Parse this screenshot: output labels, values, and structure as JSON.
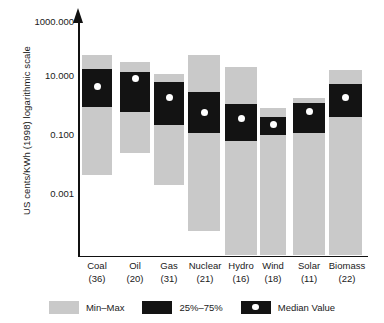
{
  "chart_data": {
    "type": "bar",
    "title": "",
    "subtitle": "",
    "xlabel": "",
    "ylabel": "US cents/KWh (1998) logarithmic scale",
    "scale": "log10",
    "ylim": [
      0.001,
      1000.0
    ],
    "grid": false,
    "legend_position": "bottom",
    "ytick_labels": [
      "1000.000",
      "10.000",
      "0.100",
      "0.001"
    ],
    "ytick_values": [
      1000.0,
      10.0,
      0.1,
      0.001
    ],
    "categories": [
      "Coal",
      "Oil",
      "Gas",
      "Nuclear",
      "Hydro",
      "Wind",
      "Solar",
      "Biomass"
    ],
    "category_counts": [
      "(36)",
      "(20)",
      "(31)",
      "(21)",
      "(16)",
      "(18)",
      "(11)",
      "(22)"
    ],
    "series": [
      {
        "name": "Min-Max",
        "values": [
          [
            0.004,
            60.0
          ],
          [
            0.03,
            25.0
          ],
          [
            0.0027,
            9.0
          ],
          [
            8.5e-06,
            100.0
          ],
          [
            0.0005,
            32.0
          ],
          [
            0.0009,
            0.95
          ],
          [
            0.0009,
            0.38
          ],
          [
            0.0014,
            11.0
          ]
        ]
      },
      {
        "name": "25%-75%",
        "values": [
          [
            1.2,
            30.0
          ],
          [
            1.0,
            14.0
          ],
          [
            0.23,
            8.0
          ],
          [
            0.15,
            3.5
          ],
          [
            0.08,
            1.5
          ],
          [
            0.12,
            0.3
          ],
          [
            0.11,
            0.55
          ],
          [
            0.5,
            6.0
          ]
        ]
      },
      {
        "name": "Median Value",
        "values": [
          5.5,
          9.0,
          1.9,
          0.72,
          0.42,
          0.2,
          0.6,
          2.0
        ]
      }
    ],
    "legend": [
      {
        "label": "Min–Max",
        "swatch": "gray",
        "color": "#c9c9c9"
      },
      {
        "label": "25%–75%",
        "swatch": "black",
        "color": "#131313"
      },
      {
        "label": "Median Value",
        "swatch": "black-dot",
        "color": "#131313",
        "dot_color": "#ffffff"
      }
    ],
    "bars_px": [
      {
        "cat": "Coal",
        "left": 4,
        "width": 30,
        "range_top": 55,
        "range_bottom": 175,
        "iqr_top": 69,
        "iqr_bottom": 107,
        "median_y": 86
      },
      {
        "cat": "Oil",
        "left": 42,
        "width": 30,
        "range_top": 62,
        "range_bottom": 153,
        "iqr_top": 72,
        "iqr_bottom": 112,
        "median_y": 78
      },
      {
        "cat": "Gas",
        "left": 76,
        "width": 30,
        "range_top": 74,
        "range_bottom": 185,
        "iqr_top": 82,
        "iqr_bottom": 125,
        "median_y": 97
      },
      {
        "cat": "Nuclear",
        "left": 110,
        "width": 32,
        "range_top": 55,
        "range_bottom": 231,
        "iqr_top": 92,
        "iqr_bottom": 133,
        "median_y": 112
      },
      {
        "cat": "Hydro",
        "left": 147,
        "width": 32,
        "range_top": 67,
        "range_bottom": 255,
        "iqr_top": 104,
        "iqr_bottom": 141,
        "median_y": 118
      },
      {
        "cat": "Wind",
        "left": 182,
        "width": 26,
        "range_top": 108,
        "range_bottom": 255,
        "iqr_top": 117,
        "iqr_bottom": 135,
        "median_y": 124
      },
      {
        "cat": "Solar",
        "left": 215,
        "width": 32,
        "range_top": 98,
        "range_bottom": 255,
        "iqr_top": 103,
        "iqr_bottom": 133,
        "median_y": 111
      },
      {
        "cat": "Biomass",
        "left": 251,
        "width": 33,
        "range_top": 70,
        "range_bottom": 255,
        "iqr_top": 84,
        "iqr_bottom": 117,
        "median_y": 97
      }
    ],
    "ytick_px": [
      22,
      76,
      135,
      194
    ],
    "xlabel_px": [
      4,
      42,
      76,
      106,
      143,
      178,
      212,
      247
    ],
    "xlabel_width": [
      30,
      30,
      30,
      42,
      40,
      34,
      38,
      44
    ]
  }
}
